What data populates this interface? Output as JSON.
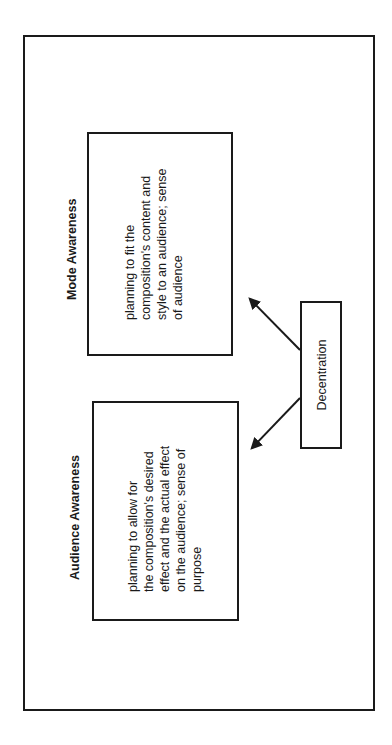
{
  "diagram": {
    "orientation": "rotated-90-ccw",
    "colors": {
      "stroke": "#1a1a1a",
      "background": "#ffffff"
    },
    "nodes": {
      "mode": {
        "title": "Mode Awareness",
        "lines": [
          "planning to fit the",
          "composition's content and",
          "style to an audience; sense",
          "of audience"
        ]
      },
      "audience": {
        "title": "Audience Awareness",
        "lines": [
          "planning to allow for",
          "the composition's desired",
          "effect and the actual effect",
          "on the audience; sense of",
          "purpose"
        ]
      },
      "decentration": {
        "label": "Decentration"
      }
    },
    "edges": [
      {
        "from": "decentration",
        "to": "mode"
      },
      {
        "from": "decentration",
        "to": "audience"
      }
    ]
  }
}
